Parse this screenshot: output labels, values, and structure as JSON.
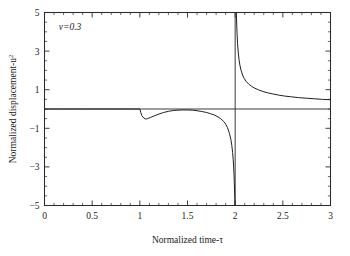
{
  "chart_data": {
    "type": "line",
    "title": "",
    "xlabel": "Normalized time-τ",
    "ylabel": "Normalized displacement-u",
    "ylabel_superscript": "2",
    "xlim": [
      0,
      3
    ],
    "ylim": [
      -5,
      5
    ],
    "grid": false,
    "legend": null,
    "annotations": [
      {
        "text": "v=0.3",
        "x": 0.15,
        "y": 4.1
      }
    ],
    "xticks": [
      0,
      0.5,
      1,
      1.5,
      2,
      2.5,
      3
    ],
    "xticklabels": [
      "0",
      "0.5",
      "1",
      "1.5",
      "2",
      "2.5",
      "3"
    ],
    "xminor_step": 0.1,
    "yticks": [
      -5,
      -3,
      -1,
      1,
      3,
      5
    ],
    "yticklabels": [
      "−5",
      "−3",
      "−1",
      "1",
      "3",
      "5"
    ],
    "yminor_step": 0.5,
    "reference_lines": [
      {
        "name": "zero-line",
        "orientation": "horizontal",
        "value": 0
      },
      {
        "name": "asymptote-line",
        "orientation": "vertical",
        "value": 2
      }
    ],
    "series": [
      {
        "name": "normalized-displacement",
        "branch_left": [
          [
            0.0,
            0.0
          ],
          [
            0.1,
            0.0
          ],
          [
            0.2,
            0.0
          ],
          [
            0.3,
            0.0
          ],
          [
            0.4,
            0.0
          ],
          [
            0.5,
            0.0
          ],
          [
            0.6,
            0.0
          ],
          [
            0.7,
            0.0
          ],
          [
            0.8,
            0.0
          ],
          [
            0.9,
            0.0
          ],
          [
            0.96,
            0.0
          ],
          [
            1.0,
            0.0
          ],
          [
            1.01,
            -0.18
          ],
          [
            1.02,
            -0.34
          ],
          [
            1.04,
            -0.46
          ],
          [
            1.06,
            -0.52
          ],
          [
            1.08,
            -0.5
          ],
          [
            1.11,
            -0.44
          ],
          [
            1.15,
            -0.36
          ],
          [
            1.2,
            -0.26
          ],
          [
            1.25,
            -0.18
          ],
          [
            1.3,
            -0.12
          ],
          [
            1.35,
            -0.08
          ],
          [
            1.4,
            -0.06
          ],
          [
            1.45,
            -0.05
          ],
          [
            1.5,
            -0.05
          ],
          [
            1.55,
            -0.06
          ],
          [
            1.6,
            -0.09
          ],
          [
            1.65,
            -0.13
          ],
          [
            1.7,
            -0.18
          ],
          [
            1.74,
            -0.24
          ],
          [
            1.78,
            -0.31
          ],
          [
            1.82,
            -0.41
          ],
          [
            1.85,
            -0.51
          ],
          [
            1.88,
            -0.65
          ],
          [
            1.9,
            -0.78
          ],
          [
            1.92,
            -0.97
          ],
          [
            1.94,
            -1.26
          ],
          [
            1.955,
            -1.58
          ],
          [
            1.965,
            -1.9
          ],
          [
            1.973,
            -2.25
          ],
          [
            1.979,
            -2.6
          ],
          [
            1.984,
            -3.0
          ],
          [
            1.988,
            -3.4
          ],
          [
            1.991,
            -3.8
          ],
          [
            1.994,
            -4.25
          ],
          [
            1.996,
            -4.6
          ],
          [
            1.998,
            -5.0
          ]
        ],
        "branch_right": [
          [
            2.012,
            5.0
          ],
          [
            2.016,
            4.4
          ],
          [
            2.02,
            3.9
          ],
          [
            2.025,
            3.4
          ],
          [
            2.032,
            2.95
          ],
          [
            2.04,
            2.58
          ],
          [
            2.05,
            2.26
          ],
          [
            2.062,
            2.0
          ],
          [
            2.078,
            1.76
          ],
          [
            2.095,
            1.58
          ],
          [
            2.115,
            1.43
          ],
          [
            2.14,
            1.3
          ],
          [
            2.17,
            1.18
          ],
          [
            2.205,
            1.08
          ],
          [
            2.245,
            0.99
          ],
          [
            2.29,
            0.91
          ],
          [
            2.34,
            0.84
          ],
          [
            2.395,
            0.78
          ],
          [
            2.455,
            0.72
          ],
          [
            2.52,
            0.67
          ],
          [
            2.59,
            0.63
          ],
          [
            2.665,
            0.59
          ],
          [
            2.745,
            0.56
          ],
          [
            2.83,
            0.53
          ],
          [
            2.915,
            0.5
          ],
          [
            3.0,
            0.48
          ]
        ]
      }
    ]
  }
}
